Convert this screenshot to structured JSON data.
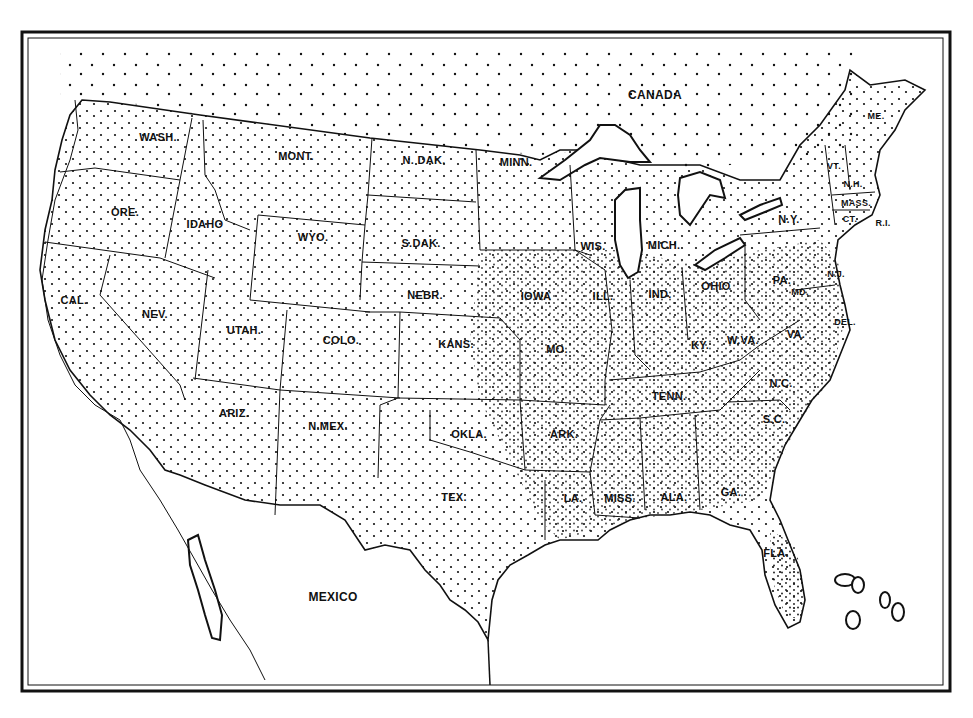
{
  "map": {
    "title": "United States dot map",
    "style": "black-and-white outline map with stippled dot density",
    "colors": {
      "ink": "#111111",
      "paper": "#ffffff"
    },
    "regions": [
      {
        "id": "canada",
        "label": "CANADA",
        "x": 655,
        "y": 95,
        "size": "big"
      },
      {
        "id": "mexico",
        "label": "MEXICO",
        "x": 333,
        "y": 597,
        "size": "big"
      }
    ],
    "states": [
      {
        "id": "wash",
        "label": "WASH.",
        "x": 158,
        "y": 137
      },
      {
        "id": "ore",
        "label": "ORE.",
        "x": 125,
        "y": 212
      },
      {
        "id": "cal",
        "label": "CAL.",
        "x": 74,
        "y": 300
      },
      {
        "id": "idaho",
        "label": "IDAHO",
        "x": 205,
        "y": 224
      },
      {
        "id": "nev",
        "label": "NEV.",
        "x": 155,
        "y": 314
      },
      {
        "id": "mont",
        "label": "MONT.",
        "x": 296,
        "y": 156
      },
      {
        "id": "wyo",
        "label": "WYO.",
        "x": 313,
        "y": 237
      },
      {
        "id": "utah",
        "label": "UTAH.",
        "x": 244,
        "y": 330
      },
      {
        "id": "colo",
        "label": "COLO.",
        "x": 341,
        "y": 340
      },
      {
        "id": "ariz",
        "label": "ARIZ.",
        "x": 234,
        "y": 413
      },
      {
        "id": "nmex",
        "label": "N.MEX.",
        "x": 328,
        "y": 426
      },
      {
        "id": "ndak",
        "label": "N. DAK.",
        "x": 424,
        "y": 160
      },
      {
        "id": "sdak",
        "label": "S.DAK.",
        "x": 421,
        "y": 243
      },
      {
        "id": "nebr",
        "label": "NEBR.",
        "x": 425,
        "y": 295
      },
      {
        "id": "kans",
        "label": "KANS.",
        "x": 456,
        "y": 344
      },
      {
        "id": "okla",
        "label": "OKLA.",
        "x": 469,
        "y": 434
      },
      {
        "id": "tex",
        "label": "TEX.",
        "x": 454,
        "y": 497
      },
      {
        "id": "minn",
        "label": "MINN.",
        "x": 516,
        "y": 162
      },
      {
        "id": "iowa",
        "label": "IOWA",
        "x": 536,
        "y": 296
      },
      {
        "id": "mo",
        "label": "MO.",
        "x": 557,
        "y": 349
      },
      {
        "id": "ark",
        "label": "ARK.",
        "x": 564,
        "y": 434
      },
      {
        "id": "la",
        "label": "LA.",
        "x": 573,
        "y": 498
      },
      {
        "id": "wis",
        "label": "WIS.",
        "x": 593,
        "y": 246
      },
      {
        "id": "ill",
        "label": "ILL.",
        "x": 603,
        "y": 296
      },
      {
        "id": "mich",
        "label": "MICH.",
        "x": 664,
        "y": 245
      },
      {
        "id": "ind",
        "label": "IND.",
        "x": 660,
        "y": 294
      },
      {
        "id": "ohio",
        "label": "OHIO",
        "x": 716,
        "y": 286
      },
      {
        "id": "ky",
        "label": "KY.",
        "x": 700,
        "y": 345
      },
      {
        "id": "tenn",
        "label": "TENN.",
        "x": 669,
        "y": 396
      },
      {
        "id": "miss",
        "label": "MISS.",
        "x": 620,
        "y": 498
      },
      {
        "id": "ala",
        "label": "ALA.",
        "x": 674,
        "y": 497
      },
      {
        "id": "ga",
        "label": "GA.",
        "x": 731,
        "y": 492
      },
      {
        "id": "fla",
        "label": "FLA.",
        "x": 776,
        "y": 553
      },
      {
        "id": "sc",
        "label": "S.C.",
        "x": 774,
        "y": 419
      },
      {
        "id": "nc",
        "label": "N.C.",
        "x": 781,
        "y": 383
      },
      {
        "id": "va",
        "label": "VA.",
        "x": 796,
        "y": 334
      },
      {
        "id": "wva",
        "label": "W.VA.",
        "x": 743,
        "y": 340
      },
      {
        "id": "md",
        "label": "MD.",
        "x": 800,
        "y": 292,
        "size": "sm"
      },
      {
        "id": "del",
        "label": "DEL.",
        "x": 845,
        "y": 322,
        "size": "sm"
      },
      {
        "id": "nj",
        "label": "N.J.",
        "x": 836,
        "y": 274,
        "size": "sm"
      },
      {
        "id": "pa",
        "label": "PA.",
        "x": 782,
        "y": 280
      },
      {
        "id": "ny",
        "label": "N.Y.",
        "x": 789,
        "y": 219
      },
      {
        "id": "vt",
        "label": "VT.",
        "x": 834,
        "y": 166,
        "size": "sm"
      },
      {
        "id": "nh",
        "label": "N.H.",
        "x": 853,
        "y": 184,
        "size": "sm"
      },
      {
        "id": "mass",
        "label": "MASS.",
        "x": 856,
        "y": 203,
        "size": "sm"
      },
      {
        "id": "ct",
        "label": "CT.",
        "x": 850,
        "y": 219,
        "size": "sm"
      },
      {
        "id": "ri",
        "label": "R.I.",
        "x": 883,
        "y": 223,
        "size": "sm"
      },
      {
        "id": "me",
        "label": "ME.",
        "x": 876,
        "y": 116,
        "size": "sm"
      }
    ]
  }
}
